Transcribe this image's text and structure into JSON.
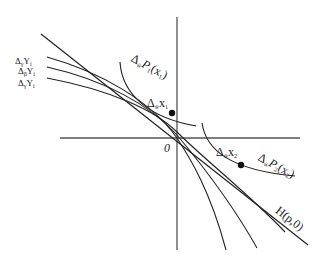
{
  "figure": {
    "axes": {
      "origin_label": "0",
      "stroke_color": "#555555"
    },
    "curve_labels": [
      {
        "delta": "Δ",
        "sub": "γ",
        "var": "Y",
        "var_sub": "i"
      },
      {
        "delta": "Δ",
        "sub": "β",
        "var": "Y",
        "var_sub": "i"
      },
      {
        "delta": "Δ",
        "sub": "γ",
        "var": "Y",
        "var_sub": "i"
      }
    ],
    "point_labels": {
      "x1": {
        "delta": "Δ",
        "sub": "w̃",
        "var": "x",
        "var_sub": "1"
      },
      "x2": {
        "delta": "Δ",
        "sub": "w̃",
        "var": "x",
        "var_sub": "2"
      }
    },
    "boundary_labels": {
      "p1": {
        "delta": "Δ",
        "sub": "w̃",
        "fn": "P",
        "fn_sub": "1",
        "arg": "(x",
        "arg_sub": "1",
        "close": ")"
      },
      "p2": {
        "delta": "Δ",
        "sub": "w̃",
        "fn": "P",
        "fn_sub": "2",
        "arg": "(x",
        "arg_sub": "2",
        "close": ")"
      }
    },
    "hyperplane_label": "H(p,0)",
    "line_color": "#222222"
  }
}
